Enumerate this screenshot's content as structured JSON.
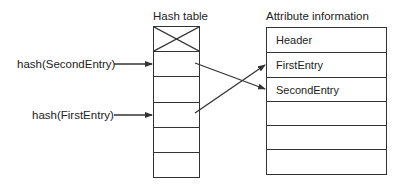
{
  "titles": {
    "hash_table": "Hash table",
    "attribute_info": "Attribute information"
  },
  "hash_inputs": [
    {
      "label": "hash(SecondEntry)",
      "slot": 1
    },
    {
      "label": "hash(FirstEntry)",
      "slot": 3
    }
  ],
  "hash_table": {
    "slots": [
      {
        "index": 0,
        "state": "reserved-crossed"
      },
      {
        "index": 1,
        "points_to": "SecondEntry"
      },
      {
        "index": 2
      },
      {
        "index": 3,
        "points_to": "FirstEntry"
      },
      {
        "index": 4
      },
      {
        "index": 5
      }
    ]
  },
  "attribute_table": {
    "rows": [
      "Header",
      "FirstEntry",
      "SecondEntry",
      "",
      "",
      ""
    ]
  },
  "colors": {
    "line": "#333333",
    "text": "#222222",
    "background": "#ffffff"
  }
}
